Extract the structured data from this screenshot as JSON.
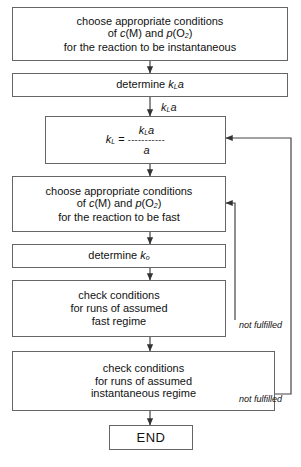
{
  "diagram": {
    "type": "flowchart",
    "orientation": "top-to-bottom",
    "stroke_color": "#666666",
    "text_color": "#111111",
    "background": "#ffffff"
  },
  "nodes": [
    {
      "id": "choose-instantaneous",
      "shape": "rectangle",
      "lines": [
        "choose appropriate conditions",
        "of c(M) and p(O2)",
        "for the reaction to be instantaneous"
      ],
      "line1": "choose appropriate conditions",
      "line2_prefix": "of ",
      "line2_sym1": "c",
      "line2_mid": "(M) and ",
      "line2_sym2": "p",
      "line2_suffix": "(O",
      "line2_sub": "2",
      "line2_end": ")",
      "line3": "for the reaction to be instantaneous"
    },
    {
      "id": "determine-kla",
      "shape": "rectangle",
      "text_prefix": "determine ",
      "sym": "k",
      "sub": "L",
      "sym2": "a"
    },
    {
      "id": "kl-formula",
      "shape": "rectangle",
      "lhs_sym": "k",
      "lhs_sub": "L",
      "equals": "=",
      "numerator_sym": "k",
      "numerator_sub": "L",
      "numerator_sym2": "a",
      "bar": "-----------",
      "denominator": "a"
    },
    {
      "id": "choose-fast",
      "shape": "rectangle",
      "lines": [
        "choose appropriate conditions",
        "of c(M) and p(O2)",
        "for the reaction to be fast"
      ],
      "line1": "choose appropriate conditions",
      "line2_prefix": "of ",
      "line2_sym1": "c",
      "line2_mid": "(M) and ",
      "line2_sym2": "p",
      "line2_suffix": "(O",
      "line2_sub": "2",
      "line2_end": ")",
      "line3": "for the reaction to be fast"
    },
    {
      "id": "determine-k0",
      "shape": "rectangle",
      "text_prefix": "determine ",
      "sym": "k",
      "sub": "o"
    },
    {
      "id": "check-fast",
      "shape": "rectangle",
      "line1": "check conditions",
      "line2": "for runs of assumed",
      "line3": "fast regime"
    },
    {
      "id": "check-instantaneous",
      "shape": "rectangle",
      "line1": "check conditions",
      "line2": "for runs of assumed",
      "line3": "instantaneous regime"
    },
    {
      "id": "end",
      "shape": "rectangle",
      "label": "END"
    }
  ],
  "annotations": {
    "kla_above_formula_sym": "k",
    "kla_above_formula_sub": "L",
    "kla_above_formula_sym2": "a",
    "not_fulfilled_fast": "not fulfilled",
    "not_fulfilled_instantaneous": "not fulfilled"
  },
  "edges": [
    {
      "from": "choose-instantaneous",
      "to": "determine-kla",
      "label": ""
    },
    {
      "from": "determine-kla",
      "to": "kl-formula",
      "label": ""
    },
    {
      "from": "kl-formula",
      "to": "choose-fast",
      "label": ""
    },
    {
      "from": "choose-fast",
      "to": "determine-k0",
      "label": ""
    },
    {
      "from": "determine-k0",
      "to": "check-fast",
      "label": ""
    },
    {
      "from": "check-fast",
      "to": "check-instantaneous",
      "label": ""
    },
    {
      "from": "check-instantaneous",
      "to": "end",
      "label": ""
    },
    {
      "from": "check-fast",
      "to": "choose-fast",
      "label": "not fulfilled",
      "kind": "feedback-inner"
    },
    {
      "from": "check-instantaneous",
      "to": "kl-formula",
      "label": "not fulfilled",
      "kind": "feedback-outer"
    }
  ]
}
